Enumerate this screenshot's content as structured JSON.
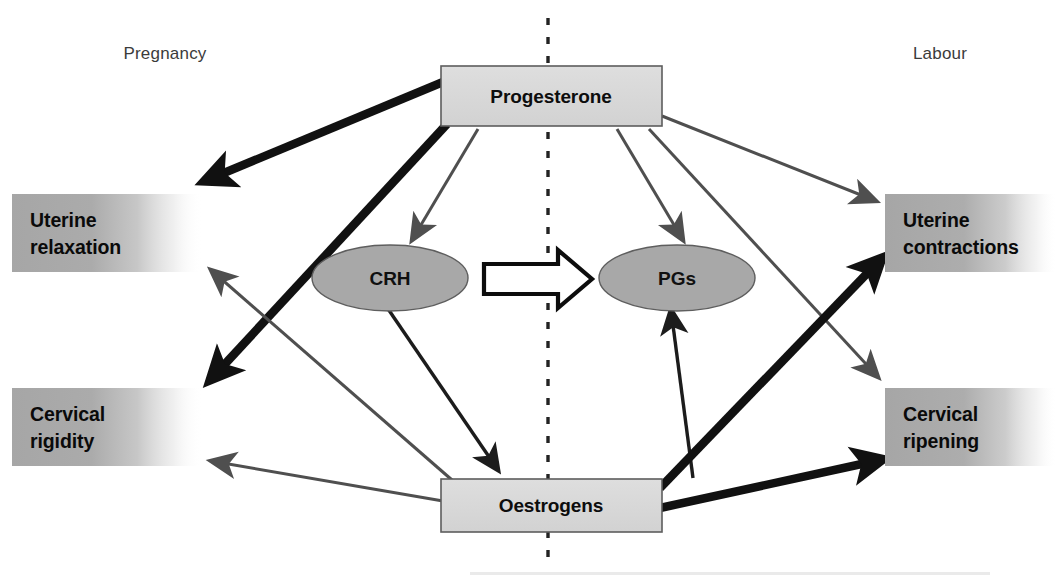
{
  "figure": {
    "phases": {
      "left": "Pregnancy",
      "right": "Labour"
    },
    "divider": {
      "style": "dashed-vertical",
      "color": "#232323"
    }
  },
  "nodes": {
    "progesterone": {
      "label": "Progesterone",
      "shape": "rectangle",
      "fill": "#d9d9d9"
    },
    "oestrogens": {
      "label": "Oestrogens",
      "shape": "rectangle",
      "fill": "#d9d9d9"
    },
    "crh": {
      "label": "CRH",
      "shape": "ellipse",
      "fill": "#a8a8a8"
    },
    "pgs": {
      "label": "PGs",
      "shape": "ellipse",
      "fill": "#a8a8a8"
    }
  },
  "outcomes": {
    "uterine_relaxation": {
      "line1": "Uterine",
      "line2": "relaxation",
      "side": "left",
      "fill": "#a9a9a9"
    },
    "cervical_rigidity": {
      "line1": "Cervical",
      "line2": "rigidity",
      "side": "left",
      "fill": "#a9a9a9"
    },
    "uterine_contractions": {
      "line1": "Uterine",
      "line2": "contractions",
      "side": "right",
      "fill": "#a9a9a9"
    },
    "cervical_ripening": {
      "line1": "Cervical",
      "line2": "ripening",
      "side": "right",
      "fill": "#a9a9a9"
    }
  },
  "connectors": [
    {
      "id": "prog-to-uterine-relaxation",
      "from": "progesterone",
      "to": "uterine_relaxation",
      "weight": "strong",
      "color": "#111111"
    },
    {
      "id": "prog-to-cervical-rigidity",
      "from": "progesterone",
      "to": "cervical_rigidity",
      "weight": "strong",
      "color": "#111111"
    },
    {
      "id": "prog-to-crh",
      "from": "progesterone",
      "to": "crh",
      "weight": "weak",
      "color": "#4f4f4f"
    },
    {
      "id": "prog-to-pgs",
      "from": "progesterone",
      "to": "pgs",
      "weight": "weak",
      "color": "#4f4f4f"
    },
    {
      "id": "prog-to-uterine-contractions",
      "from": "progesterone",
      "to": "uterine_contractions",
      "weight": "weak",
      "color": "#4f4f4f"
    },
    {
      "id": "prog-to-cervical-ripening",
      "from": "progesterone",
      "to": "cervical_ripening",
      "weight": "weak",
      "color": "#4f4f4f"
    },
    {
      "id": "crh-to-oestrogens",
      "from": "crh",
      "to": "oestrogens",
      "weight": "medium",
      "color": "#1c1c1c"
    },
    {
      "id": "oestrogens-to-pgs",
      "from": "oestrogens",
      "to": "pgs",
      "weight": "medium",
      "color": "#1c1c1c"
    },
    {
      "id": "oestrogens-to-uterine-relaxation",
      "from": "oestrogens",
      "to": "uterine_relaxation",
      "weight": "weak",
      "color": "#4f4f4f"
    },
    {
      "id": "oestrogens-to-cervical-rigidity",
      "from": "oestrogens",
      "to": "cervical_rigidity",
      "weight": "weak",
      "color": "#4f4f4f"
    },
    {
      "id": "oestrogens-to-uterine-contractions",
      "from": "oestrogens",
      "to": "uterine_contractions",
      "weight": "strong",
      "color": "#111111"
    },
    {
      "id": "oestrogens-to-cervical-ripening",
      "from": "oestrogens",
      "to": "cervical_ripening",
      "weight": "strong",
      "color": "#111111"
    },
    {
      "id": "crh-to-pgs-block",
      "from": "crh",
      "to": "pgs",
      "weight": "block",
      "color": "#0d0d0d"
    }
  ]
}
